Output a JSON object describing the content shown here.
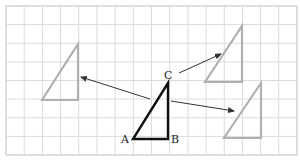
{
  "diagram": {
    "grid": {
      "x0": 6,
      "y0": 6,
      "x1": 297,
      "y1": 155,
      "cols": 16,
      "rows": 8,
      "line_color": "#dcdcdc",
      "border_color": "#cfcfcf"
    },
    "original_triangle": {
      "color": "#111111",
      "vertices": {
        "A": [
          133,
          139
        ],
        "B": [
          168,
          139
        ],
        "C": [
          168,
          83
        ]
      },
      "labels": [
        {
          "text": "A",
          "x": 121,
          "y": 143
        },
        {
          "text": "B",
          "x": 171,
          "y": 143
        },
        {
          "text": "C",
          "x": 164,
          "y": 79
        }
      ]
    },
    "images": [
      {
        "name": "left",
        "color": "#b0b0b0",
        "points": [
          [
            42,
            100
          ],
          [
            78,
            44
          ],
          [
            78,
            100
          ]
        ]
      },
      {
        "name": "top-right",
        "color": "#b0b0b0",
        "points": [
          [
            205,
            82
          ],
          [
            242,
            26
          ],
          [
            242,
            82
          ]
        ]
      },
      {
        "name": "bottom-right",
        "color": "#b0b0b0",
        "points": [
          [
            224,
            138
          ],
          [
            261,
            83
          ],
          [
            261,
            138
          ]
        ]
      }
    ],
    "arrows": [
      {
        "name": "to-left",
        "from": [
          150,
          99
        ],
        "to": [
          81,
          77
        ]
      },
      {
        "name": "to-top-right",
        "from": [
          179,
          73
        ],
        "to": [
          221,
          54
        ]
      },
      {
        "name": "to-bottom-right",
        "from": [
          171,
          101
        ],
        "to": [
          234,
          111
        ]
      }
    ],
    "arrow_color": "#333333"
  }
}
